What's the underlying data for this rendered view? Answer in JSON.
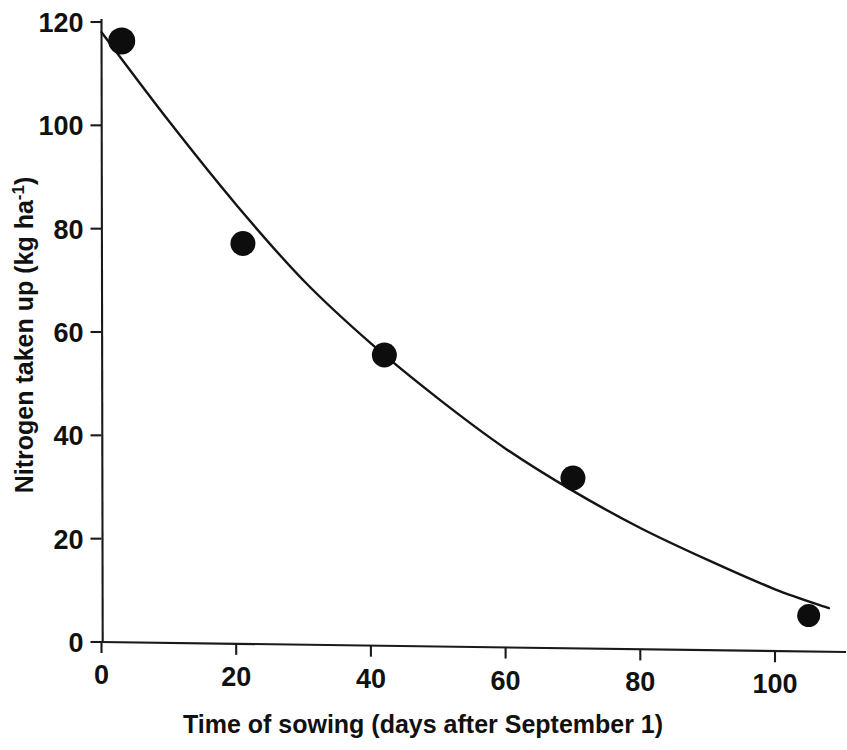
{
  "figure": {
    "background_color": "#ffffff",
    "ink_color": "#111111"
  },
  "chart_data": {
    "type": "scatter",
    "title": "",
    "subtitle": "",
    "xlabel": "Time of sowing (days after September 1)",
    "ylabel": "Nitrogen taken up (kg ha-1)",
    "ylabel_parts": {
      "main": "Nitrogen taken up (kg ha",
      "superscript": "-1",
      "tail": ")"
    },
    "xlim": [
      0,
      108
    ],
    "ylim": [
      0,
      124
    ],
    "xticks": [
      0,
      20,
      40,
      60,
      80,
      100
    ],
    "xtick_labels": [
      "0",
      "20",
      "40",
      "60",
      "80",
      "100"
    ],
    "yticks": [
      0,
      20,
      40,
      60,
      80,
      100,
      120
    ],
    "ytick_labels": [
      "0",
      "20",
      "40",
      "60",
      "80",
      "100",
      "120"
    ],
    "grid": false,
    "legend": null,
    "legend_position": "none",
    "marker": "filled-circle",
    "marker_color": "#0d0d0d",
    "line_color": "#141414",
    "x": [
      3,
      21,
      42,
      70,
      105
    ],
    "y": [
      116.4,
      77.5,
      56.3,
      33.0,
      7.0
    ],
    "series": [
      {
        "name": "Nitrogen taken up",
        "points": [
          {
            "x": 3,
            "y": 116.4
          },
          {
            "x": 21,
            "y": 77.5
          },
          {
            "x": 42,
            "y": 56.3
          },
          {
            "x": 70,
            "y": 33.0
          },
          {
            "x": 105,
            "y": 7.0
          }
        ]
      },
      {
        "name": "fitted curve",
        "type": "line",
        "points": [
          {
            "x": 0,
            "y": 118.0
          },
          {
            "x": 10,
            "y": 101.0
          },
          {
            "x": 20,
            "y": 85.0
          },
          {
            "x": 30,
            "y": 70.5
          },
          {
            "x": 40,
            "y": 58.5
          },
          {
            "x": 50,
            "y": 48.0
          },
          {
            "x": 60,
            "y": 38.5
          },
          {
            "x": 70,
            "y": 30.5
          },
          {
            "x": 80,
            "y": 23.5
          },
          {
            "x": 90,
            "y": 17.5
          },
          {
            "x": 100,
            "y": 12.0
          },
          {
            "x": 108,
            "y": 8.5
          }
        ]
      }
    ],
    "annotations": []
  }
}
